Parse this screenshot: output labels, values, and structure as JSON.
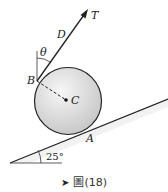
{
  "figure": {
    "labels": {
      "tension": "T",
      "point_d": "D",
      "angle_theta": "θ",
      "point_b": "B",
      "center": "C",
      "point_a": "A",
      "incline_angle": "25°"
    },
    "incline_angle_deg": 25,
    "colors": {
      "line": "#222222",
      "sphere_fill_light": "#f4f4f4",
      "sphere_fill_dark": "#c8c8c8",
      "incline_fill": "#d9d9d9"
    }
  },
  "caption": {
    "icon": "flag-arrow-icon",
    "text": "圖(18)"
  }
}
